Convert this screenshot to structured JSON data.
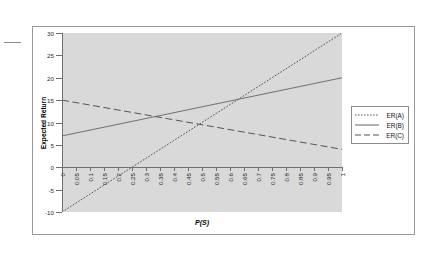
{
  "chart_data": {
    "type": "line",
    "title": "",
    "xlabel": "P(S)",
    "ylabel": "Expected Return",
    "xlim": [
      0,
      1
    ],
    "ylim": [
      -10,
      30
    ],
    "grid": false,
    "legend_position": "right-outside",
    "x_ticks": [
      "0",
      "0.05",
      "0.1",
      "0.15",
      "0.2",
      "0.25",
      "0.3",
      "0.35",
      "0.4",
      "0.45",
      "0.5",
      "0.55",
      "0.6",
      "0.65",
      "0.7",
      "0.75",
      "0.8",
      "0.85",
      "0.9",
      "0.95",
      "1"
    ],
    "y_ticks": [
      "-10",
      "-5",
      "0",
      "5",
      "10",
      "15",
      "20",
      "25",
      "30"
    ],
    "x": [
      0,
      0.05,
      0.1,
      0.15,
      0.2,
      0.25,
      0.3,
      0.35,
      0.4,
      0.45,
      0.5,
      0.55,
      0.6,
      0.65,
      0.7,
      0.75,
      0.8,
      0.85,
      0.9,
      0.95,
      1
    ],
    "series": [
      {
        "name": "ER(A)",
        "style": "dotted",
        "color": "#555555",
        "values": [
          -10,
          -8,
          -6,
          -4,
          -2,
          0,
          2,
          4,
          6,
          8,
          10,
          12,
          14,
          16,
          18,
          20,
          22,
          24,
          26,
          28,
          30
        ]
      },
      {
        "name": "ER(B)",
        "style": "solid",
        "color": "#555555",
        "values": [
          7,
          7.65,
          8.3,
          8.95,
          9.6,
          10.25,
          10.9,
          11.55,
          12.2,
          12.85,
          13.5,
          14.15,
          14.8,
          15.45,
          16.1,
          16.75,
          17.4,
          18.05,
          18.7,
          19.35,
          20
        ]
      },
      {
        "name": "ER(C)",
        "style": "dashed",
        "color": "#555555",
        "values": [
          15,
          14.45,
          13.9,
          13.35,
          12.8,
          12.25,
          11.7,
          11.15,
          10.6,
          10.05,
          9.5,
          8.95,
          8.4,
          7.85,
          7.3,
          6.75,
          6.2,
          5.65,
          5.1,
          4.55,
          4
        ]
      }
    ],
    "legend": [
      "ER(A)",
      "ER(B)",
      "ER(C)"
    ],
    "plot_background": "#d9d9d9",
    "frame_color": "#9a9a9a"
  }
}
